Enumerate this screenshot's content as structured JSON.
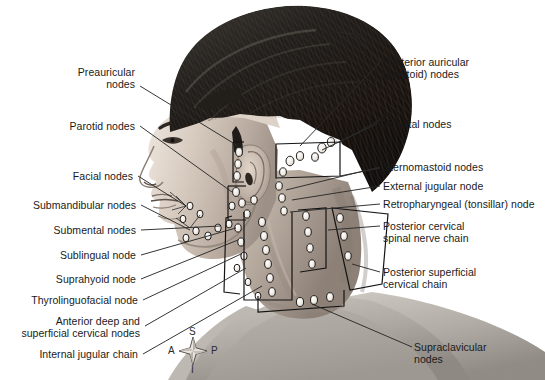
{
  "colors": {
    "background": "#ffffff",
    "text": "#1a1a1a",
    "leader_line": "#2a2a2a",
    "node_outline": "#1f1f1f",
    "node_fill": "#f2f0ee",
    "bracket": "#141414",
    "skin_light": "#d8cfc6",
    "skin_mid": "#b6aaa0",
    "skin_shadow": "#8e8279",
    "hair_dark": "#1c1a18",
    "hair_mid": "#3a3631",
    "shirt": "#b9b4ae"
  },
  "labels_left": [
    {
      "id": "preauricular-nodes",
      "lines": [
        "Preauricular",
        "nodes"
      ],
      "x": 60,
      "y": 66,
      "right": 135
    },
    {
      "id": "parotid-nodes",
      "lines": [
        "Parotid nodes"
      ],
      "x": 52,
      "y": 120,
      "right": 135
    },
    {
      "id": "facial-nodes",
      "lines": [
        "Facial nodes"
      ],
      "x": 57,
      "y": 170,
      "right": 133
    },
    {
      "id": "submandibular-nodes",
      "lines": [
        "Submandibular nodes"
      ],
      "x": 12,
      "y": 199,
      "right": 136
    },
    {
      "id": "submental-nodes",
      "lines": [
        "Submental nodes"
      ],
      "x": 32,
      "y": 225,
      "right": 136
    },
    {
      "id": "sublingual-node",
      "lines": [
        "Sublingual node"
      ],
      "x": 39,
      "y": 249,
      "right": 136
    },
    {
      "id": "suprahyoid-node",
      "lines": [
        "Suprahyoid node"
      ],
      "x": 35,
      "y": 273,
      "right": 136
    },
    {
      "id": "thyrolinguofacial-node",
      "lines": [
        "Thyrolinguofacial node"
      ],
      "x": 12,
      "y": 295,
      "right": 138
    },
    {
      "id": "anterior-deep-superficial",
      "lines": [
        "Anterior deep and",
        "superficial cervical nodes"
      ],
      "x": 6,
      "y": 315,
      "right": 140
    },
    {
      "id": "internal-jugular-chain",
      "lines": [
        "Internal jugular chain"
      ],
      "x": 12,
      "y": 349,
      "right": 138
    }
  ],
  "labels_right": [
    {
      "id": "posterior-auricular-mastoid-nodes",
      "lines": [
        "Posterior auricular",
        "(mastoid) nodes"
      ],
      "x": 383,
      "y": 56
    },
    {
      "id": "occipital-nodes",
      "lines": [
        "Occipital nodes"
      ],
      "x": 379,
      "y": 119
    },
    {
      "id": "sternomastoid-nodes",
      "lines": [
        "Sternomastoid nodes"
      ],
      "x": 383,
      "y": 161
    },
    {
      "id": "external-jugular-node",
      "lines": [
        "External jugular node"
      ],
      "x": 383,
      "y": 180
    },
    {
      "id": "retropharyngeal-tonsillar-node",
      "lines": [
        "Retropharyngeal (tonsillar) node"
      ],
      "x": 383,
      "y": 198
    },
    {
      "id": "posterior-cervical-spinal-nerve-chain",
      "lines": [
        "Posterior cervical",
        "spinal nerve chain"
      ],
      "x": 383,
      "y": 220
    },
    {
      "id": "posterior-superficial-cervical-chain",
      "lines": [
        "Posterior superficial",
        "cervical chain"
      ],
      "x": 383,
      "y": 266
    },
    {
      "id": "supraclavicular-nodes",
      "lines": [
        "Supraclavicular",
        "nodes"
      ],
      "x": 414,
      "y": 341
    }
  ],
  "compass": {
    "name": "orientation-compass",
    "superior": "S",
    "inferior": "I",
    "anterior": "A",
    "posterior": "P",
    "center_x": 193,
    "center_y": 351
  }
}
